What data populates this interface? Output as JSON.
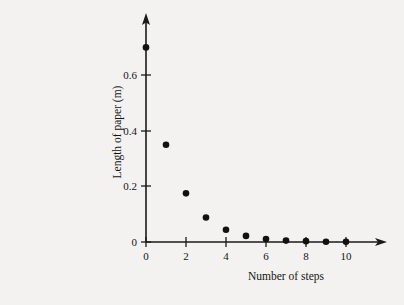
{
  "chart_data": {
    "type": "scatter",
    "title": "",
    "xlabel": "Number of steps",
    "ylabel": "Length of paper (m)",
    "x": [
      0,
      1,
      2,
      3,
      4,
      5,
      6,
      7,
      8,
      9,
      10
    ],
    "values": [
      0.7,
      0.35,
      0.175,
      0.088,
      0.044,
      0.022,
      0.011,
      0.005,
      0.003,
      0.001,
      0.001
    ],
    "series": [
      {
        "name": "Length of paper",
        "values": [
          0.7,
          0.35,
          0.175,
          0.088,
          0.044,
          0.022,
          0.011,
          0.005,
          0.003,
          0.001,
          0.001
        ]
      }
    ],
    "xlim": [
      0,
      11.6
    ],
    "ylim": [
      0,
      0.78
    ],
    "xticks": [
      0,
      2,
      4,
      6,
      8,
      10
    ],
    "yticks": [
      0,
      0.2,
      0.4,
      0.6
    ],
    "xticklabels": [
      "0",
      "2",
      "4",
      "6",
      "8",
      "10"
    ],
    "yticklabels": [
      "0",
      "0.2",
      "0.4",
      "0.6"
    ],
    "grid": false,
    "legend": false,
    "legend_position": "none",
    "marker": "filled-circle",
    "marker_color": "#111111",
    "background_color": "#f3f2f0",
    "axis_color": "#1a1a1a",
    "axis_style": "arrow-tipped-open-axes",
    "annotations": []
  },
  "figure": {
    "x_axis_title": "Number of steps",
    "y_axis_title": "Length of paper (m)"
  }
}
